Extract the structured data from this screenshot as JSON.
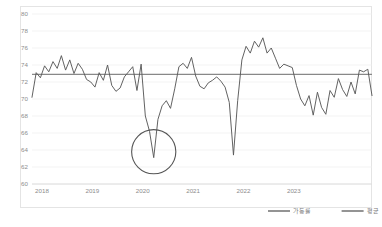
{
  "chart_data": {
    "type": "line",
    "title": "",
    "subtitle": "",
    "xlabel": "",
    "ylabel": "",
    "ylim": [
      60,
      80
    ],
    "y_ticks": [
      60,
      62,
      64,
      66,
      68,
      70,
      72,
      74,
      76,
      78,
      80
    ],
    "x_ticks": [
      "2018",
      "2019",
      "2020",
      "2021",
      "2022",
      "2023"
    ],
    "x_tick_positions": [
      0,
      12,
      24,
      36,
      48,
      60
    ],
    "grid": true,
    "legend_position": "bottom-right",
    "series": [
      {
        "name": "가동률",
        "color": "#5a5a5a",
        "style": "line",
        "values": [
          70.2,
          73.1,
          72.5,
          73.9,
          73.2,
          74.4,
          73.6,
          75.1,
          73.4,
          74.6,
          73.0,
          74.2,
          73.5,
          72.3,
          72.0,
          71.4,
          73.1,
          72.2,
          74.0,
          71.6,
          70.9,
          71.3,
          72.6,
          73.2,
          73.8,
          71.0,
          74.1,
          68.0,
          66.2,
          63.1,
          67.6,
          69.2,
          69.8,
          68.9,
          71.2,
          73.8,
          74.2,
          73.6,
          74.9,
          72.7,
          71.5,
          71.2,
          71.9,
          72.2,
          72.6,
          72.1,
          71.4,
          69.6,
          63.4,
          69.8,
          74.6,
          76.2,
          75.4,
          76.8,
          76.1,
          77.2,
          75.4,
          76.0,
          74.8,
          73.6,
          74.1,
          73.9,
          73.7,
          71.6,
          70.0,
          69.2,
          70.4,
          68.1,
          70.8,
          69.0,
          68.2,
          71.0,
          70.2,
          72.4,
          71.1,
          70.3,
          72.0,
          70.6,
          73.4,
          73.2,
          73.5,
          70.4
        ]
      },
      {
        "name": "평균",
        "color": "#888888",
        "style": "horizontal-reference",
        "value": 72.9
      }
    ],
    "annotations": [
      {
        "name": "covid-dip-highlight",
        "shape": "circle",
        "x_index": 29,
        "y_value": 63.8,
        "radius_units": 2.6,
        "color": "#555555"
      }
    ]
  },
  "legend": {
    "items": [
      {
        "label": "가동률",
        "color": "#5a5a5a"
      },
      {
        "label": "평균",
        "color": "#888888"
      }
    ]
  },
  "axis": {
    "y_labels": [
      "80",
      "78",
      "76",
      "74",
      "72",
      "70",
      "68",
      "66",
      "64",
      "62",
      "60"
    ],
    "x_labels": [
      "2018",
      "2019",
      "2020",
      "2021",
      "2022",
      "2023"
    ]
  }
}
